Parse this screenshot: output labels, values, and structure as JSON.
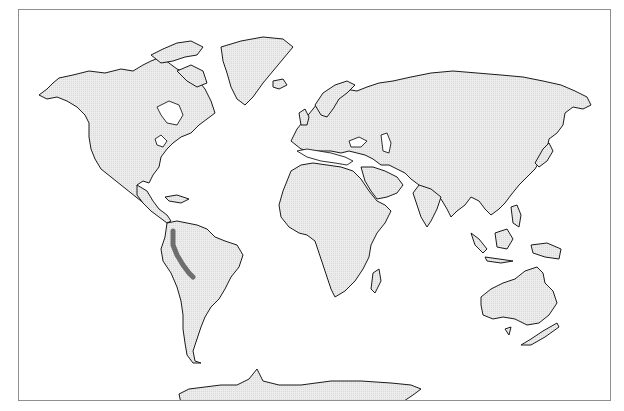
{
  "map": {
    "projection": "world-outline",
    "land_color": "#e6e6e6",
    "ocean_color": "#ffffff",
    "coastline_color": "#1a1a1a",
    "frame_color": "#8f8f8f",
    "highlight": {
      "region": "Andes (northern & central)",
      "color": "#6e6e6e"
    },
    "continents": [
      "North America",
      "Greenland",
      "South America",
      "Europe",
      "Africa",
      "Asia",
      "Australia",
      "New Zealand",
      "Antarctica"
    ]
  }
}
